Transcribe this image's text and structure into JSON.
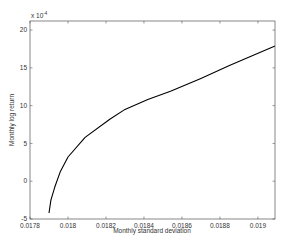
{
  "chart_data": {
    "type": "line",
    "title": "",
    "xlabel": "Monthly standard deviation",
    "ylabel": "Monthly log return",
    "y_multiplier_label": "x 10",
    "y_multiplier_exponent": "-4",
    "xlim": [
      0.0178,
      0.01909
    ],
    "ylim": [
      -5,
      21.2
    ],
    "grid": false,
    "legend": null,
    "x_ticks": [
      0.0178,
      0.018,
      0.0182,
      0.0184,
      0.0186,
      0.0188,
      0.019
    ],
    "x_tick_labels": [
      "0.0178",
      "0.018",
      "0.0182",
      "0.0184",
      "0.0186",
      "0.0188",
      "0.019"
    ],
    "y_ticks": [
      -5,
      0,
      5,
      10,
      15,
      20
    ],
    "y_tick_labels": [
      "-5",
      "0",
      "5",
      "10",
      "15",
      "20"
    ],
    "series": [
      {
        "name": "Efficient frontier",
        "color": "#000000",
        "x": [
          0.0179,
          0.01791,
          0.01793,
          0.01796,
          0.018,
          0.01809,
          0.01822,
          0.0183,
          0.01842,
          0.01854,
          0.0187,
          0.01885,
          0.01897,
          0.01909
        ],
        "y": [
          -4.2,
          -2.5,
          -0.8,
          1.3,
          3.2,
          5.8,
          8.2,
          9.5,
          10.8,
          11.9,
          13.6,
          15.3,
          16.6,
          17.9
        ]
      }
    ]
  }
}
